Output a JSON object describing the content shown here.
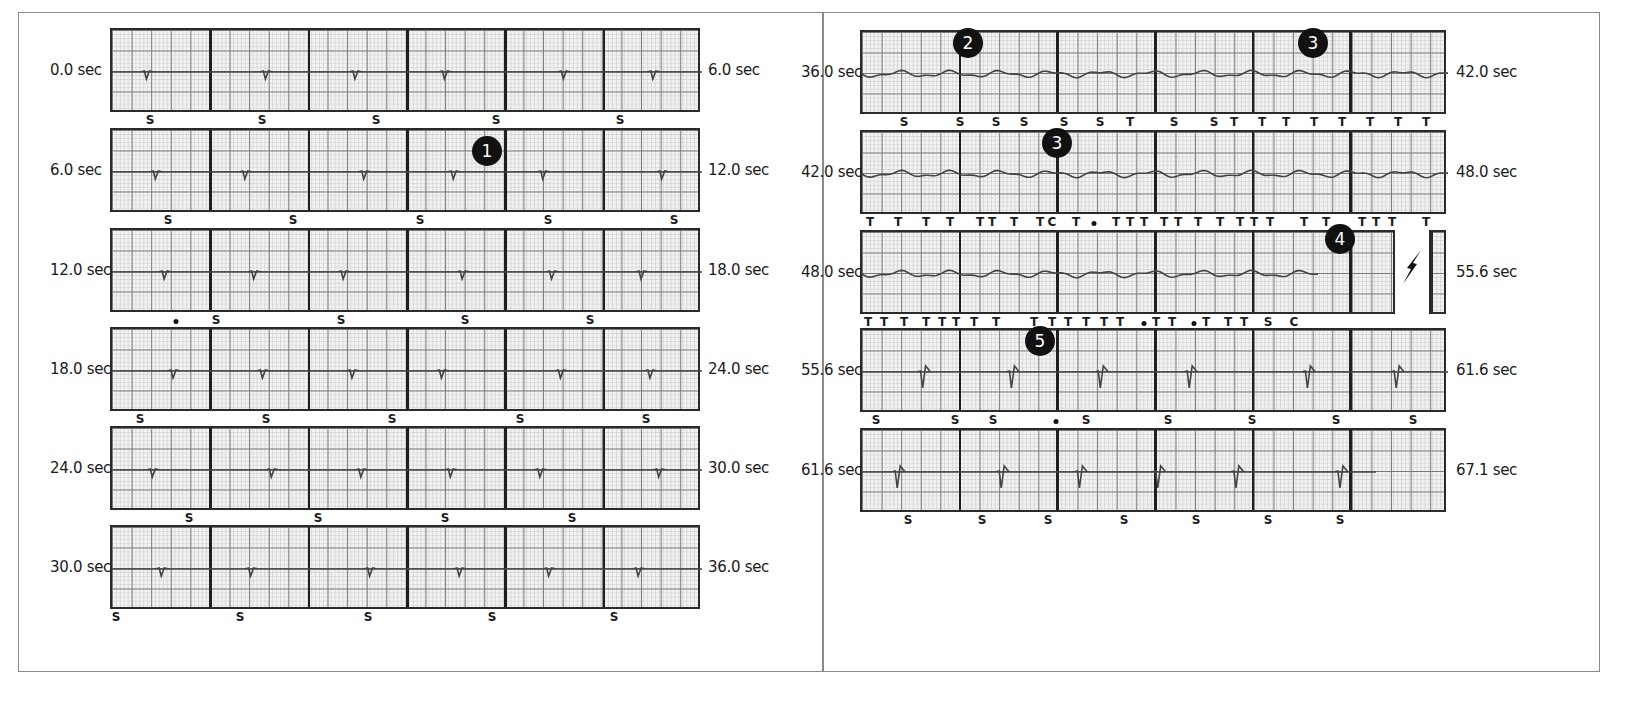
{
  "figure": {
    "panels": [
      {
        "id": "left",
        "strips": [
          {
            "start": "0.0 sec",
            "end": "6.0 sec",
            "marks": [
              {
                "t": "S",
                "x": 150
              },
              {
                "t": "S",
                "x": 262
              },
              {
                "t": "S",
                "x": 376
              },
              {
                "t": "S",
                "x": 496
              },
              {
                "t": "S",
                "x": 620
              }
            ]
          },
          {
            "start": "6.0 sec",
            "end": "12.0 sec",
            "marks": [
              {
                "t": "S",
                "x": 168
              },
              {
                "t": "S",
                "x": 293
              },
              {
                "t": "S",
                "x": 420
              },
              {
                "t": "S",
                "x": 548
              },
              {
                "t": "S",
                "x": 674
              }
            ]
          },
          {
            "start": "12.0 sec",
            "end": "18.0 sec",
            "marks": [
              {
                "t": "•",
                "x": 176
              },
              {
                "t": "S",
                "x": 216
              },
              {
                "t": "S",
                "x": 341
              },
              {
                "t": "S",
                "x": 465
              },
              {
                "t": "S",
                "x": 590
              }
            ]
          },
          {
            "start": "18.0 sec",
            "end": "24.0 sec",
            "marks": [
              {
                "t": "S",
                "x": 140
              },
              {
                "t": "S",
                "x": 266
              },
              {
                "t": "S",
                "x": 392
              },
              {
                "t": "S",
                "x": 520
              },
              {
                "t": "S",
                "x": 646
              }
            ]
          },
          {
            "start": "24.0 sec",
            "end": "30.0 sec",
            "marks": [
              {
                "t": "S",
                "x": 189
              },
              {
                "t": "S",
                "x": 318
              },
              {
                "t": "S",
                "x": 445
              },
              {
                "t": "S",
                "x": 572
              }
            ]
          },
          {
            "start": "30.0 sec",
            "end": "36.0 sec",
            "marks": [
              {
                "t": "S",
                "x": 116
              },
              {
                "t": "S",
                "x": 240
              },
              {
                "t": "S",
                "x": 368
              },
              {
                "t": "S",
                "x": 492
              },
              {
                "t": "S",
                "x": 614
              }
            ]
          }
        ]
      },
      {
        "id": "right",
        "strips": [
          {
            "start": "36.0 sec",
            "end": "42.0 sec",
            "marks": [
              {
                "t": "S",
                "x": 904
              },
              {
                "t": "S",
                "x": 960
              },
              {
                "t": "S",
                "x": 996
              },
              {
                "t": "S",
                "x": 1024
              },
              {
                "t": "S",
                "x": 1064
              },
              {
                "t": "S",
                "x": 1100
              },
              {
                "t": "T",
                "x": 1130
              },
              {
                "t": "S",
                "x": 1174
              },
              {
                "t": "S",
                "x": 1214
              },
              {
                "t": "T",
                "x": 1234
              },
              {
                "t": "T",
                "x": 1262
              },
              {
                "t": "T",
                "x": 1286
              },
              {
                "t": "T",
                "x": 1314
              },
              {
                "t": "T",
                "x": 1342
              },
              {
                "t": "T",
                "x": 1370
              },
              {
                "t": "T",
                "x": 1398
              },
              {
                "t": "T",
                "x": 1426
              }
            ]
          },
          {
            "start": "42.0 sec",
            "end": "48.0 sec",
            "marks": [
              {
                "t": "T",
                "x": 870
              },
              {
                "t": "T",
                "x": 898
              },
              {
                "t": "T",
                "x": 926
              },
              {
                "t": "T",
                "x": 950
              },
              {
                "t": "T",
                "x": 980
              },
              {
                "t": "T",
                "x": 992
              },
              {
                "t": "T",
                "x": 1014
              },
              {
                "t": "T",
                "x": 1040
              },
              {
                "t": "C",
                "x": 1052
              },
              {
                "t": "T",
                "x": 1076
              },
              {
                "t": "•",
                "x": 1094
              },
              {
                "t": "T",
                "x": 1116
              },
              {
                "t": "T",
                "x": 1130
              },
              {
                "t": "T",
                "x": 1144
              },
              {
                "t": "T",
                "x": 1164
              },
              {
                "t": "T",
                "x": 1178
              },
              {
                "t": "T",
                "x": 1198
              },
              {
                "t": "T",
                "x": 1220
              },
              {
                "t": "T",
                "x": 1240
              },
              {
                "t": "T",
                "x": 1254
              },
              {
                "t": "T",
                "x": 1270
              },
              {
                "t": "T",
                "x": 1304
              },
              {
                "t": "T",
                "x": 1326
              },
              {
                "t": "T",
                "x": 1362
              },
              {
                "t": "T",
                "x": 1376
              },
              {
                "t": "T",
                "x": 1392
              },
              {
                "t": "T",
                "x": 1426
              }
            ]
          },
          {
            "start": "48.0 sec",
            "end": "55.6 sec",
            "marks": [
              {
                "t": "T",
                "x": 868
              },
              {
                "t": "T",
                "x": 884
              },
              {
                "t": "T",
                "x": 904
              },
              {
                "t": "T",
                "x": 926
              },
              {
                "t": "T",
                "x": 942
              },
              {
                "t": "T",
                "x": 956
              },
              {
                "t": "T",
                "x": 974
              },
              {
                "t": "T",
                "x": 996
              },
              {
                "t": "T",
                "x": 1034
              },
              {
                "t": "T",
                "x": 1052
              },
              {
                "t": "T",
                "x": 1068
              },
              {
                "t": "T",
                "x": 1086
              },
              {
                "t": "T",
                "x": 1104
              },
              {
                "t": "T",
                "x": 1120
              },
              {
                "t": "•",
                "x": 1144
              },
              {
                "t": "T",
                "x": 1156
              },
              {
                "t": "T",
                "x": 1172
              },
              {
                "t": "•",
                "x": 1194
              },
              {
                "t": "T",
                "x": 1206
              },
              {
                "t": "T",
                "x": 1228
              },
              {
                "t": "T",
                "x": 1244
              },
              {
                "t": "S",
                "x": 1268
              },
              {
                "t": "C",
                "x": 1294
              }
            ]
          },
          {
            "start": "55.6 sec",
            "end": "61.6 sec",
            "marks": [
              {
                "t": "S",
                "x": 876
              },
              {
                "t": "S",
                "x": 955
              },
              {
                "t": "S",
                "x": 993
              },
              {
                "t": "•",
                "x": 1056
              },
              {
                "t": "S",
                "x": 1086
              },
              {
                "t": "S",
                "x": 1168
              },
              {
                "t": "S",
                "x": 1252
              },
              {
                "t": "S",
                "x": 1336
              },
              {
                "t": "S",
                "x": 1413
              }
            ]
          },
          {
            "start": "61.6 sec",
            "end": "67.1 sec",
            "marks": [
              {
                "t": "S",
                "x": 908
              },
              {
                "t": "S",
                "x": 982
              },
              {
                "t": "S",
                "x": 1048
              },
              {
                "t": "S",
                "x": 1124
              },
              {
                "t": "S",
                "x": 1196
              },
              {
                "t": "S",
                "x": 1268
              },
              {
                "t": "S",
                "x": 1340
              }
            ]
          }
        ]
      }
    ],
    "annotations": [
      {
        "label": "1",
        "x": 487,
        "y": 136
      },
      {
        "label": "2",
        "x": 968,
        "y": 28
      },
      {
        "label": "3",
        "x": 1313,
        "y": 28
      },
      {
        "label": "3",
        "x": 1057,
        "y": 128
      },
      {
        "label": "4",
        "x": 1340,
        "y": 224
      },
      {
        "label": "5",
        "x": 1040,
        "y": 326
      }
    ],
    "shock_symbol": "defibrillation-shock-icon"
  },
  "chart_data": {
    "type": "line",
    "xlabel": "time (sec)",
    "ylabel": "",
    "segments": [
      "0.0-6.0",
      "6.0-12.0",
      "12.0-18.0",
      "18.0-24.0",
      "24.0-30.0",
      "30.0-36.0",
      "36.0-42.0",
      "42.0-48.0",
      "48.0-55.6",
      "55.6-61.6",
      "61.6-67.1"
    ],
    "beat_annotation_legend": {
      "S": "sensed/sinus beat",
      "T": "tachy beat",
      "C": "classified",
      "•": "marker"
    },
    "numbered_events": [
      "1",
      "2",
      "3",
      "3",
      "4",
      "5"
    ],
    "grid": true,
    "x_range": [
      0.0,
      67.1
    ]
  }
}
